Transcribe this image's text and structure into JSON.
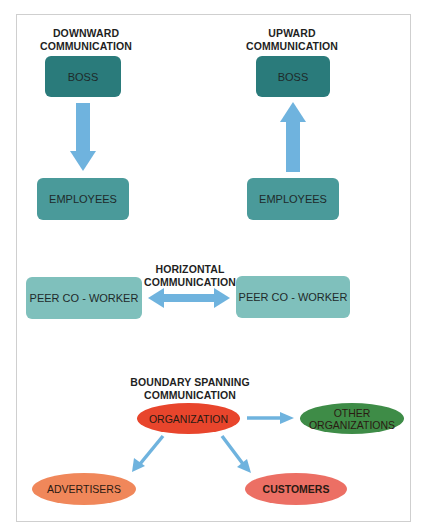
{
  "downward": {
    "title_line1": "DOWNWARD",
    "title_line2": "COMMUNICATION",
    "top": "BOSS",
    "bottom": "EMPLOYEES"
  },
  "upward": {
    "title_line1": "UPWARD",
    "title_line2": "COMMUNICATION",
    "top": "BOSS",
    "bottom": "EMPLOYEES"
  },
  "horizontal": {
    "title_line1": "HORIZONTAL",
    "title_line2": "COMMUNICATION",
    "left": "PEER CO - WORKER",
    "right": "PEER CO - WORKER"
  },
  "boundary": {
    "title_line1": "BOUNDARY SPANNING",
    "title_line2": "COMMUNICATION",
    "center": "ORGANIZATION",
    "other_line1": "OTHER",
    "other_line2": "ORGANIZATIONS",
    "advertisers": "ADVERTISERS",
    "customers": "CUSTOMERS"
  },
  "colors": {
    "boss": "#2a7b7b",
    "employees": "#4a9a9a",
    "peer": "#7fc0bc",
    "arrow": "#6fb3de",
    "organization": "#e8452c",
    "other": "#3e8c47",
    "advertisers": "#f0875a",
    "customers": "#ec6f64"
  }
}
